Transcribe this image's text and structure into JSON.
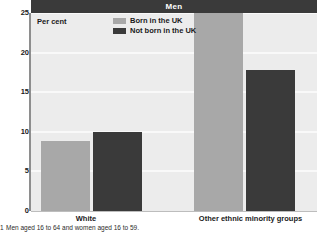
{
  "chart_data": {
    "type": "bar",
    "title": "Men",
    "ylabel": "Per cent",
    "xlabel": "",
    "categories": [
      "White",
      "Other ethnic minority groups"
    ],
    "series": [
      {
        "name": "Born in the UK",
        "color": "#a8a8a8",
        "values": [
          8.9,
          25.0
        ]
      },
      {
        "name": "Not born in the UK",
        "color": "#3a3a3a",
        "values": [
          10.0,
          17.8
        ]
      }
    ],
    "ylim": [
      0,
      25
    ],
    "yticks": [
      "0",
      "5",
      "10",
      "15",
      "20",
      "25"
    ],
    "ytick_values": [
      0,
      5,
      10,
      15,
      20,
      25
    ],
    "grid": true,
    "legend_position": "top-center",
    "footnote_marker": "1",
    "footnote": "Men aged 16 to 64 and women aged 16 to 59."
  },
  "colors": {
    "title_bar": "#3a3a3a",
    "plot_background": "#ececec",
    "gridline": "#f9f9f9",
    "axis": "#8e8e8e",
    "series_light": "#a8a8a8",
    "series_dark": "#3a3a3a",
    "text": "#1a1a1a"
  }
}
